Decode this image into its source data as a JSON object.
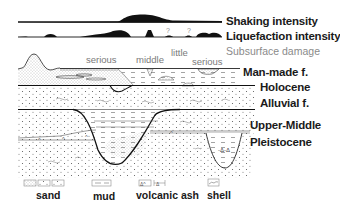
{
  "intensity_bars": {
    "shaking": {
      "label": "Shaking intensity"
    },
    "liquefaction": {
      "label": "Liquefaction intensity",
      "uncertain_marks": [
        "?",
        "?"
      ]
    }
  },
  "subsurface_damage": {
    "label": "Subsurface damage",
    "levels": [
      {
        "label": "serious"
      },
      {
        "label": "middle"
      },
      {
        "label": "little"
      },
      {
        "label": "serious"
      }
    ]
  },
  "strata": [
    {
      "label": "Man-made f."
    },
    {
      "label": "Holocene"
    },
    {
      "label": "Alluvial f."
    },
    {
      "label": "Upper-Middle"
    },
    {
      "label": "Pleistocene"
    }
  ],
  "legend": [
    {
      "label": "sand",
      "icon": "sand-pattern-icon"
    },
    {
      "label": "mud",
      "icon": "mud-pattern-icon"
    },
    {
      "label": "volcanic ash",
      "icon": "volcanic-ash-pattern-icon"
    },
    {
      "label": "shell",
      "icon": "shell-pattern-icon"
    }
  ],
  "colors": {
    "ink": "#1a1a1a",
    "damage_text": "#8a8a8a",
    "background": "#ffffff"
  }
}
